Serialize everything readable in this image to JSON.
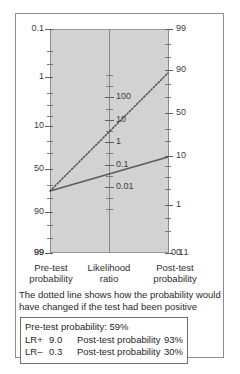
{
  "figure": {
    "type": "fagan-nomogram"
  },
  "chart_data": {
    "type": "line",
    "xlabel": "",
    "ylabel": "",
    "grid": false,
    "legend_position": "below",
    "axes": [
      {
        "name": "pre-test-probability",
        "label_line1": "Pre-test",
        "label_line2": "probability",
        "unit": "%",
        "orientation": "left",
        "scale": "logit-reversed",
        "ticks": [
          {
            "value": "0.1",
            "pos": 0.0,
            "major": true
          },
          {
            "value": "",
            "pos": 0.1,
            "major": false
          },
          {
            "value": "",
            "pos": 0.155,
            "major": false
          },
          {
            "value": "1",
            "pos": 0.215,
            "major": true
          },
          {
            "value": "",
            "pos": 0.285,
            "major": false
          },
          {
            "value": "",
            "pos": 0.34,
            "major": false
          },
          {
            "value": "",
            "pos": 0.39,
            "major": false
          },
          {
            "value": "10",
            "pos": 0.435,
            "major": true
          },
          {
            "value": "",
            "pos": 0.5,
            "major": false
          },
          {
            "value": "",
            "pos": 0.555,
            "major": false
          },
          {
            "value": "50",
            "pos": 0.625,
            "major": true
          },
          {
            "value": "",
            "pos": 0.695,
            "major": false
          },
          {
            "value": "",
            "pos": 0.755,
            "major": false
          },
          {
            "value": "90",
            "pos": 0.815,
            "major": true
          },
          {
            "value": "",
            "pos": 0.875,
            "major": false
          },
          {
            "value": "",
            "pos": 0.935,
            "major": false
          },
          {
            "value": "99",
            "pos": 1.0,
            "major": true
          }
        ]
      },
      {
        "name": "likelihood-ratio",
        "label_line1": "Likelihood",
        "label_line2": "ratio",
        "unit": "",
        "orientation": "center",
        "scale": "log",
        "ticks": [
          {
            "value": "",
            "pos": 0.205,
            "major": false
          },
          {
            "value": "",
            "pos": 0.255,
            "major": false
          },
          {
            "value": "100",
            "pos": 0.305,
            "major": true
          },
          {
            "value": "",
            "pos": 0.355,
            "major": false
          },
          {
            "value": "10",
            "pos": 0.405,
            "major": true
          },
          {
            "value": "",
            "pos": 0.455,
            "major": false
          },
          {
            "value": "1",
            "pos": 0.505,
            "major": true
          },
          {
            "value": "",
            "pos": 0.555,
            "major": false
          },
          {
            "value": "0.1",
            "pos": 0.605,
            "major": true
          },
          {
            "value": "",
            "pos": 0.655,
            "major": false
          },
          {
            "value": "0.01",
            "pos": 0.705,
            "major": true
          },
          {
            "value": "",
            "pos": 0.755,
            "major": false
          },
          {
            "value": "",
            "pos": 0.805,
            "major": false
          }
        ]
      },
      {
        "name": "post-test-probability",
        "label_line1": "Post-test",
        "label_line2": "probability",
        "unit": "%",
        "orientation": "right",
        "scale": "logit",
        "ticks": [
          {
            "value": "99",
            "pos": 0.0,
            "major": true
          },
          {
            "value": "",
            "pos": 0.065,
            "major": false
          },
          {
            "value": "",
            "pos": 0.125,
            "major": false
          },
          {
            "value": "90",
            "pos": 0.185,
            "major": true
          },
          {
            "value": "",
            "pos": 0.245,
            "major": false
          },
          {
            "value": "",
            "pos": 0.305,
            "major": false
          },
          {
            "value": "50",
            "pos": 0.375,
            "major": true
          },
          {
            "value": "",
            "pos": 0.445,
            "major": false
          },
          {
            "value": "",
            "pos": 0.5,
            "major": false
          },
          {
            "value": "10",
            "pos": 0.565,
            "major": true
          },
          {
            "value": "",
            "pos": 0.61,
            "major": false
          },
          {
            "value": "",
            "pos": 0.66,
            "major": false
          },
          {
            "value": "",
            "pos": 0.715,
            "major": false
          },
          {
            "value": "1",
            "pos": 0.785,
            "major": true
          },
          {
            "value": "",
            "pos": 0.845,
            "major": false
          },
          {
            "value": "",
            "pos": 0.9,
            "major": false
          },
          {
            "value": "0.1",
            "pos": 1.0,
            "major": true
          }
        ]
      }
    ],
    "series": [
      {
        "name": "negative-test-line",
        "style": "solid",
        "color": "#5a5a5a",
        "pretest_percent": 59,
        "likelihood_ratio": 0.3,
        "posttest_percent": 30,
        "points": [
          [
            34,
            177
          ],
          [
            93,
            160
          ],
          [
            152,
            143
          ]
        ]
      },
      {
        "name": "positive-test-line",
        "style": "dotted",
        "color": "#4a4a4a",
        "pretest_percent": 59,
        "likelihood_ratio": 9.0,
        "posttest_percent": 93,
        "points": [
          [
            34,
            177
          ],
          [
            93,
            118
          ],
          [
            152,
            59
          ]
        ]
      }
    ]
  },
  "note": {
    "text": "The dotted line shows how the probability would have changed if the test had been positive"
  },
  "results": {
    "pretest_line": "Pre-test probability: 59%",
    "rows": [
      {
        "lr_label": "LR+",
        "lr_value": "9.0",
        "posttest_label": "Post-test probability",
        "posttest_value": "93%"
      },
      {
        "lr_label": "LR–",
        "lr_value": "0.3",
        "posttest_label": "Post-test probability",
        "posttest_value": "30%"
      }
    ]
  },
  "endpoints": {
    "left_bottom": "99",
    "right_bottom": "0.1"
  },
  "colors": {
    "plot_fill": "#d2d2d2",
    "border": "#8d8d8d",
    "text": "#2e2e2e",
    "solid_line": "#5a5a5a",
    "dotted_line": "#4a4a4a"
  }
}
